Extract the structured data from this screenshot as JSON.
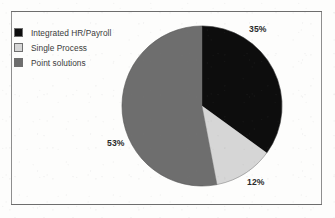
{
  "chart_data": {
    "type": "pie",
    "title": "",
    "subtitle": "",
    "xlabel": "",
    "ylabel": "",
    "legend_position": "top-left",
    "grid": false,
    "categories": [
      "Integrated HR/Payroll",
      "Single Process",
      "Point solutions"
    ],
    "values": [
      35,
      12,
      53
    ],
    "value_labels": [
      "35%",
      "12%",
      "53%"
    ],
    "colors": [
      "#0d0d0d",
      "#d6d6d6",
      "#6e6e6e"
    ],
    "slices": [
      {
        "label": "Integrated HR/Payroll",
        "value": 35,
        "value_label": "35%",
        "color": "#0d0d0d",
        "start_angle_deg": 0,
        "end_angle_deg": 126
      },
      {
        "label": "Single Process",
        "value": 12,
        "value_label": "12%",
        "color": "#d6d6d6",
        "start_angle_deg": 126,
        "end_angle_deg": 169.2
      },
      {
        "label": "Point solutions",
        "value": 53,
        "value_label": "53%",
        "color": "#6e6e6e",
        "start_angle_deg": 169.2,
        "end_angle_deg": 360
      }
    ]
  },
  "legend": {
    "items": [
      {
        "label": "Integrated HR/Payroll",
        "color": "#0d0d0d"
      },
      {
        "label": "Single Process",
        "color": "#d6d6d6"
      },
      {
        "label": "Point solutions",
        "color": "#6e6e6e"
      }
    ]
  },
  "labels": {
    "pct_0": "35%",
    "pct_1": "12%",
    "pct_2": "53%"
  },
  "style": {
    "background": "#ffffff",
    "frame_border": "#8e8e8e",
    "text_color": "#3a3a3a",
    "label_color": "#2a2a2a"
  }
}
